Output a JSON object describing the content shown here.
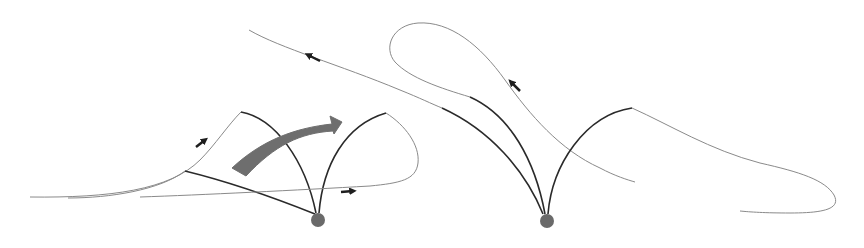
{
  "diagram": {
    "colors": {
      "background": "#ffffff",
      "thin_line": "#7a7a7a",
      "thick_line": "#2a2a2a",
      "pivot": "#6a6a6a",
      "big_arrow": "#6e6e6e",
      "small_arrow": "#1e1e1e"
    },
    "left_panel": {
      "pivot": {
        "cx": 318,
        "cy": 220,
        "r": 7
      },
      "big_arrow": {
        "label": "",
        "direction": "clockwise-right"
      },
      "small_arrows": [
        {
          "name": "arrow-up-right",
          "x": 203,
          "y": 141,
          "angle": -40
        },
        {
          "name": "arrow-right",
          "x": 347,
          "y": 191,
          "angle": 0
        }
      ]
    },
    "right_panel": {
      "pivot": {
        "cx": 547,
        "cy": 221,
        "r": 7
      },
      "small_arrows": [
        {
          "name": "arrow-up-left-top",
          "x": 314,
          "y": 58,
          "angle": 200
        },
        {
          "name": "arrow-up-left-loop",
          "x": 515,
          "y": 87,
          "angle": 220
        }
      ]
    }
  }
}
